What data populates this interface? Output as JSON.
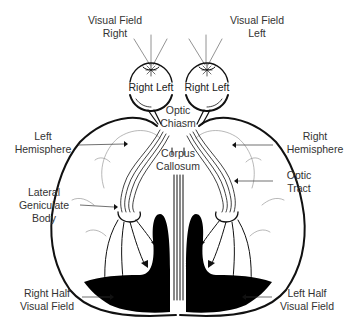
{
  "labels": {
    "visual_field_right": [
      "Visual Field",
      "Right"
    ],
    "visual_field_left": [
      "Visual Field",
      "Left"
    ],
    "right_eye": "Right Left",
    "left_eye": "Right Left",
    "optic_chiasm": [
      "Optic",
      "Chiasm"
    ],
    "corpus_callosum": [
      "Corpus",
      "Callosum"
    ],
    "left_hemisphere": [
      "Left",
      "Hemisphere"
    ],
    "right_hemisphere": [
      "Right",
      "Hemisphere"
    ],
    "lateral_geniculate_body": [
      "Lateral",
      "Geniculate",
      "Body"
    ],
    "optic_tract": [
      "Optic",
      "Tract"
    ],
    "right_half_visual_field": [
      "Right Half",
      "Visual Field"
    ],
    "left_half_visual_field": [
      "Left Half",
      "Visual Field"
    ]
  },
  "colors": {
    "ink": "#111111",
    "label": "#333333",
    "fill_cortex": "#000000",
    "background": "#ffffff"
  }
}
